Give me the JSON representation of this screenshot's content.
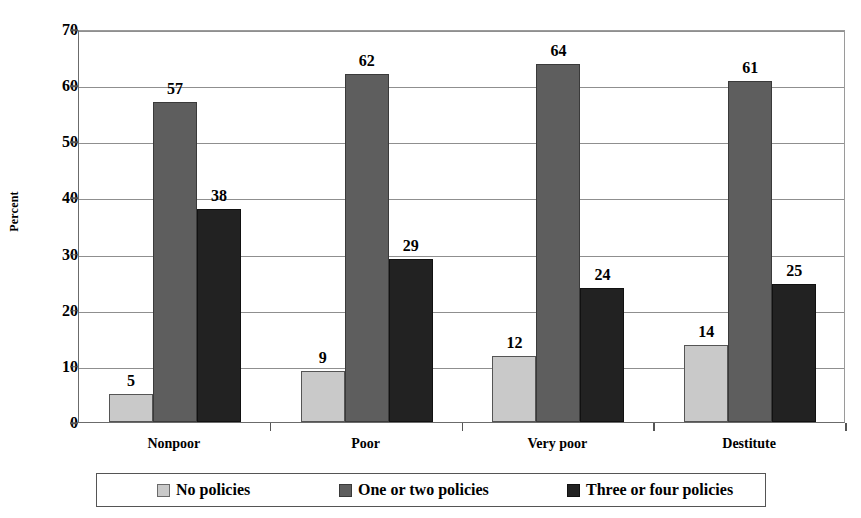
{
  "chart_data": {
    "type": "bar",
    "title": "",
    "xlabel": "",
    "ylabel": "Percent",
    "categories": [
      "Nonpoor",
      "Poor",
      "Very poor",
      "Destitute"
    ],
    "series": [
      {
        "name": "No policies",
        "color": "#c9c9c9",
        "values": [
          5,
          9,
          12,
          14
        ],
        "plotted": [
          5.0,
          9.0,
          11.8,
          13.8
        ]
      },
      {
        "name": "One or two policies",
        "color": "#5e5e5e",
        "values": [
          57,
          62,
          64,
          61
        ],
        "plotted": [
          57.0,
          62.0,
          63.8,
          60.7
        ]
      },
      {
        "name": "Three or four policies",
        "color": "#222222",
        "values": [
          38,
          29,
          24,
          25
        ],
        "plotted": [
          38.0,
          29.0,
          23.8,
          24.5
        ]
      }
    ],
    "ylim": [
      0,
      70
    ],
    "yticks": [
      0,
      10,
      20,
      30,
      40,
      50,
      60,
      70
    ],
    "ytick_labels": [
      "0",
      "10",
      "20",
      "30",
      "40",
      "50",
      "60",
      "70"
    ],
    "grid": true,
    "grid_axis": "y",
    "legend_position": "bottom",
    "data_labels_shown": true
  },
  "legend": {
    "items": [
      {
        "label": "No policies",
        "swatch": "legend-swatch-no-policies"
      },
      {
        "label": "One or two policies",
        "swatch": "legend-swatch-one-or-two-policies"
      },
      {
        "label": "Three or four policies",
        "swatch": "legend-swatch-three-or-four-policies"
      }
    ]
  }
}
